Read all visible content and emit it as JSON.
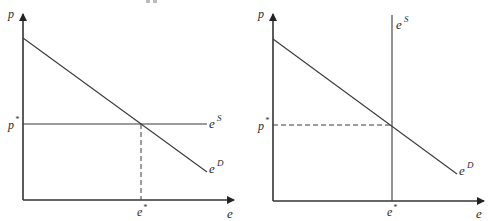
{
  "figure": {
    "panels": [
      {
        "id": "left",
        "description": "Horizontal (perfectly elastic) supply with downward-sloping demand",
        "y_axis_label": "p",
        "x_axis_label": "e",
        "price_eq_label": "p",
        "price_eq_sup": "*",
        "qty_eq_label": "e",
        "qty_eq_sup": "*",
        "supply_label": "e",
        "supply_sup": "S",
        "demand_label": "e",
        "demand_sup": "D"
      },
      {
        "id": "right",
        "description": "Vertical (perfectly inelastic) supply with downward-sloping demand",
        "y_axis_label": "p",
        "x_axis_label": "e",
        "price_eq_label": "p",
        "price_eq_sup": "*",
        "qty_eq_label": "e",
        "qty_eq_sup": "*",
        "supply_label": "e",
        "supply_sup": "S",
        "demand_label": "e",
        "demand_sup": "D"
      }
    ]
  },
  "colors": {
    "line": "#3a3a3a",
    "axis": "#333333",
    "text": "#2a2a2a",
    "background": "#ffffff"
  }
}
